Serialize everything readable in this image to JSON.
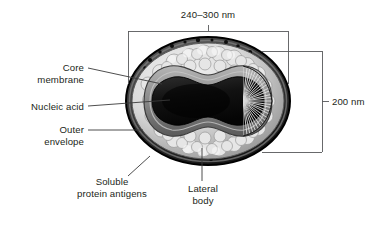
{
  "figure": {
    "background_color": "#ffffff",
    "text_color": "#231f20",
    "line_color": "#58595b"
  },
  "dimensions": {
    "width_label": "240–300 nm",
    "height_label": "200 nm"
  },
  "callouts": {
    "core_membrane": {
      "line1": "Core",
      "line2": "membrane"
    },
    "nucleic_acid": {
      "line1": "Nucleic acid"
    },
    "outer_envelope": {
      "line1": "Outer",
      "line2": "envelope"
    },
    "soluble_protein_antigens": {
      "line1": "Soluble",
      "line2": "protein antigens"
    },
    "lateral_body": {
      "line1": "Lateral",
      "line2": "body"
    }
  },
  "virion": {
    "outer_envelope_color": "#1a1a1a",
    "soluble_antigen_color": "#d6d6d6",
    "core_membrane_color": "#8a8a8a",
    "nucleic_acid_color": "#141414",
    "lateral_body_color": "#2a2a2a"
  }
}
